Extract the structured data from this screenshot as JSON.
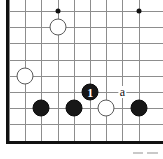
{
  "figure": {
    "kind": "go-board-diagram",
    "width": 163,
    "height": 159,
    "background_color": "#ffffff"
  },
  "board": {
    "grid_color": "#8d8d8d",
    "edge_color": "#111111",
    "origin_x": 9,
    "origin_y": 11,
    "spacing": 16.2,
    "columns": 9,
    "rows": 9,
    "edges": [
      {
        "name": "left-edge",
        "side": "left"
      },
      {
        "name": "bottom-edge",
        "side": "bottom"
      }
    ],
    "star_points": [
      {
        "name": "star-point-top-left",
        "col": 3,
        "row": 0
      },
      {
        "name": "star-point-top-right",
        "col": 8,
        "row": 0
      }
    ]
  },
  "stones": [
    {
      "name": "white-stone-upper-left",
      "color": "white",
      "col": 3,
      "row": 1,
      "radius": 8.5,
      "label": ""
    },
    {
      "name": "white-stone-left-side",
      "color": "white",
      "col": 1,
      "row": 4,
      "radius": 8.5,
      "label": ""
    },
    {
      "name": "black-stone-move-1",
      "color": "black",
      "col": 5,
      "row": 5,
      "radius": 8.5,
      "label": "1"
    },
    {
      "name": "black-stone-bottom-left",
      "color": "black",
      "col": 2,
      "row": 6,
      "radius": 8.5,
      "label": ""
    },
    {
      "name": "black-stone-bottom-center",
      "color": "black",
      "col": 4,
      "row": 6,
      "radius": 8.5,
      "label": ""
    },
    {
      "name": "white-stone-bottom",
      "color": "white",
      "col": 6,
      "row": 6,
      "radius": 8.5,
      "label": ""
    },
    {
      "name": "black-stone-bottom-right",
      "color": "black",
      "col": 8,
      "row": 6,
      "radius": 8.5,
      "label": ""
    }
  ],
  "point_markers": [
    {
      "name": "point-marker-a",
      "text": "a",
      "col": 7,
      "row": 5
    }
  ],
  "artifacts": [
    {
      "name": "scan-artifact-left",
      "x": 133,
      "y": 152,
      "width": 10,
      "height": 2
    },
    {
      "name": "scan-artifact-right",
      "x": 147,
      "y": 152,
      "width": 11,
      "height": 2
    }
  ]
}
